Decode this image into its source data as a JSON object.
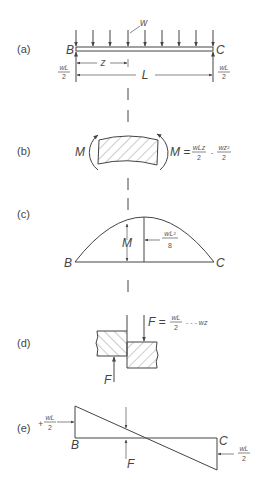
{
  "figure": {
    "panels": [
      {
        "id": "a",
        "label": "(a)",
        "description": "Simply supported beam BC with uniform load w"
      },
      {
        "id": "b",
        "label": "(b)",
        "description": "Beam segment under bending moment M"
      },
      {
        "id": "c",
        "label": "(c)",
        "description": "Bending moment diagram (parabola)"
      },
      {
        "id": "d",
        "label": "(d)",
        "description": "Shear force F across a section"
      },
      {
        "id": "e",
        "label": "(e)",
        "description": "Shear force diagram (linear)"
      }
    ],
    "a": {
      "load": "w",
      "left_support": "B",
      "right_support": "C",
      "reaction_num": "wL",
      "reaction_den": "2",
      "distance": "z",
      "length": "L"
    },
    "b": {
      "moment_left": "M",
      "eq_lhs": "M =",
      "term1_num": "wLz",
      "term1_den": "2",
      "minus": "-",
      "term2_num": "wz²",
      "term2_den": "2"
    },
    "c": {
      "left": "B",
      "right": "C",
      "moment": "M",
      "max_num": "wL²",
      "max_den": "8"
    },
    "d": {
      "eq_lhs": "F =",
      "term1_num": "wL",
      "term1_den": "2",
      "term2": "- - - wz",
      "force_bottom": "F"
    },
    "e": {
      "left_sign": "+",
      "left_num": "wL",
      "left_den": "2",
      "left": "B",
      "right": "C",
      "force": "F",
      "right_num": "wL",
      "right_den": "2"
    }
  }
}
